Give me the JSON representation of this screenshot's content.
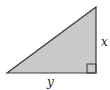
{
  "diagram": {
    "type": "right-triangle",
    "colors": {
      "fill": "#c9c9c9",
      "stroke": "#3a3a3a",
      "label": "#222222"
    },
    "vertices": {
      "left": [
        7,
        73
      ],
      "right_angle": [
        96,
        73
      ],
      "top": [
        96,
        7
      ]
    },
    "labels": {
      "vertical_side": "x",
      "horizontal_side": "y"
    },
    "right_angle_marker": true
  }
}
